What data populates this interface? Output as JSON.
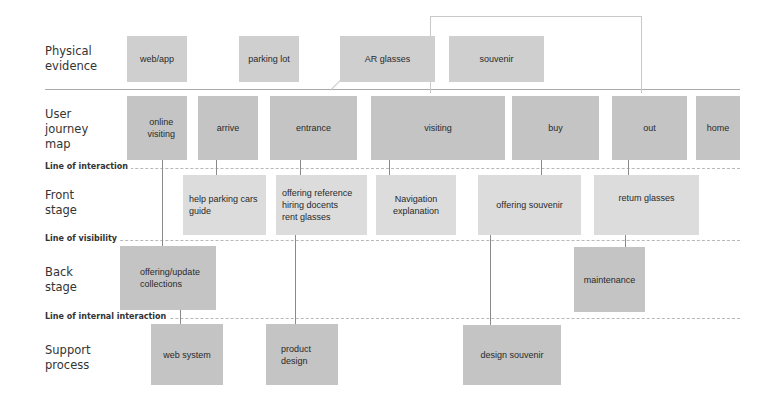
{
  "lanes": {
    "physical_evidence": "Physical\nevidence",
    "user_journey": "User\njourney\nmap",
    "front_stage": "Front\nstage",
    "back_stage": "Back\nstage",
    "support": "Support\nprocess"
  },
  "divider_lines": {
    "interaction": "Line of interaction",
    "visibility": "Line of visibility",
    "internal": "Line of internal interaction"
  },
  "physical_evidence": [
    "web/app",
    "parking lot",
    "AR glasses",
    "souvenir"
  ],
  "user_journey": [
    "online\nvisiting",
    "arrive",
    "entrance",
    "visiting",
    "buy",
    "out",
    "home"
  ],
  "front_stage": [
    "help parking cars\nguide",
    "offering reference\nhiring docents\nrent glasses",
    "Navigation\nexplanation",
    "offering souvenir",
    "retum glasses"
  ],
  "back_stage": [
    "offering/update\ncollections",
    "maintenance"
  ],
  "support": [
    "web system",
    "product\ndesign",
    "design souvenir"
  ],
  "colors": {
    "box": "#cfcfcf",
    "line": "#8a8a8a",
    "divider": "#b8b8b8"
  }
}
